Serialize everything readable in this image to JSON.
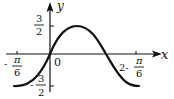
{
  "figure": {
    "type": "function-graph",
    "axes": {
      "x_label": "x",
      "y_label": "y",
      "origin_label": "0"
    },
    "y_ticks": [
      {
        "label_num": "3",
        "label_den": "2",
        "sign": "",
        "value": 1.5
      },
      {
        "label_num": "3",
        "label_den": "2",
        "sign": "-",
        "value": -1.5
      }
    ],
    "x_ticks": [
      {
        "prefix": "-",
        "label_num": "π",
        "label_den": "6",
        "value": "-π/6"
      },
      {
        "prefix": "2-",
        "label_num": "π",
        "label_den": "6",
        "value": "2-π/6"
      }
    ],
    "curve": {
      "amplitude": 1.5,
      "color": "#111111",
      "start_x": "-π/6",
      "end_x": "2-π/6"
    }
  }
}
